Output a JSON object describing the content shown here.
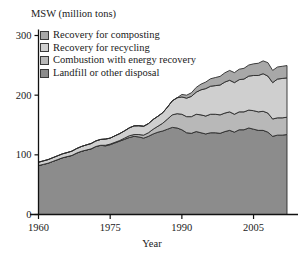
{
  "figure": {
    "clipped_top_title": "",
    "y_axis_title": "MSW (million tons)",
    "x_axis_title": "Year"
  },
  "legend": {
    "items": [
      {
        "label": "Recovery for composting",
        "color": "#a8a8a8",
        "swatch": "legend-swatch-composting"
      },
      {
        "label": "Recovery for recycling",
        "color": "#cfcfcf",
        "swatch": "legend-swatch-recycling"
      },
      {
        "label": "Combustion with energy recovery",
        "color": "#b8b8b8",
        "swatch": "legend-swatch-combustion"
      },
      {
        "label": "Landfill or other disposal",
        "color": "#8c8c8c",
        "swatch": "legend-swatch-landfill"
      }
    ]
  },
  "axes": {
    "y_ticks": [
      "0",
      "100",
      "200",
      "300"
    ],
    "x_ticks": [
      "1960",
      "1975",
      "1990",
      "2005"
    ]
  },
  "chart_data": {
    "type": "area",
    "title": "MSW (million tons)",
    "xlabel": "Year",
    "ylabel": "MSW (million tons)",
    "xlim": [
      1960,
      2012
    ],
    "ylim": [
      0,
      300
    ],
    "grid": false,
    "legend_position": "top-left-inside",
    "stacked": true,
    "stack_order_bottom_to_top": [
      "Landfill or other disposal",
      "Combustion with energy recovery",
      "Recovery for recycling",
      "Recovery for composting"
    ],
    "x": [
      1960,
      1961,
      1962,
      1963,
      1964,
      1965,
      1966,
      1967,
      1968,
      1969,
      1970,
      1971,
      1972,
      1973,
      1974,
      1975,
      1976,
      1977,
      1978,
      1979,
      1980,
      1981,
      1982,
      1983,
      1984,
      1985,
      1986,
      1987,
      1988,
      1989,
      1990,
      1991,
      1992,
      1993,
      1994,
      1995,
      1996,
      1997,
      1998,
      1999,
      2000,
      2001,
      2002,
      2003,
      2004,
      2005,
      2006,
      2007,
      2008,
      2009,
      2010,
      2011,
      2012
    ],
    "series": [
      {
        "name": "Landfill or other disposal",
        "color": "#8c8c8c",
        "values": [
          82,
          84,
          86,
          89,
          92,
          95,
          97,
          99,
          103,
          106,
          108,
          110,
          114,
          116,
          115,
          117,
          120,
          123,
          126,
          129,
          131,
          130,
          128,
          131,
          135,
          138,
          140,
          143,
          146,
          145,
          142,
          137,
          136,
          139,
          137,
          135,
          137,
          137,
          136,
          139,
          141,
          138,
          142,
          142,
          145,
          143,
          141,
          141,
          138,
          131,
          133,
          133,
          134
        ]
      },
      {
        "name": "Combustion with energy recovery",
        "color": "#b8b8b8",
        "values": [
          0,
          0,
          0,
          0,
          0,
          0,
          0,
          0,
          0,
          0,
          0,
          0,
          0,
          0,
          1,
          1,
          1,
          1,
          2,
          3,
          3,
          4,
          5,
          6,
          8,
          10,
          13,
          17,
          21,
          24,
          26,
          27,
          28,
          29,
          30,
          30,
          31,
          31,
          31,
          31,
          31,
          30,
          30,
          30,
          30,
          31,
          31,
          32,
          32,
          29,
          29,
          29,
          29
        ]
      },
      {
        "name": "Recovery for recycling",
        "color": "#cfcfcf",
        "values": [
          5.6,
          5.8,
          6.0,
          6.2,
          6.4,
          6.6,
          6.8,
          7.2,
          7.6,
          8.0,
          8.6,
          8.9,
          9.3,
          9.8,
          10.4,
          10.0,
          10.9,
          11.6,
          12.2,
          13.2,
          14.5,
          14.8,
          14.9,
          15.3,
          16.3,
          16.7,
          17.6,
          20.1,
          23.5,
          26.6,
          29.0,
          31.0,
          34.0,
          37.0,
          42.0,
          46.0,
          47.0,
          48.0,
          50.0,
          52.0,
          53.0,
          53.0,
          54.0,
          55.0,
          57.0,
          59.0,
          61.0,
          63.0,
          62.0,
          61.0,
          65.0,
          66.0,
          66.0
        ]
      },
      {
        "name": "Recovery for composting",
        "color": "#a8a8a8",
        "values": [
          0,
          0,
          0,
          0,
          0,
          0,
          0,
          0,
          0,
          0,
          0,
          0,
          0,
          0,
          0,
          0,
          0,
          0,
          0,
          0,
          0,
          0,
          0,
          0,
          0,
          0,
          0,
          0,
          0,
          0,
          4.2,
          5.0,
          6.0,
          8.0,
          9.5,
          11.0,
          12.5,
          13.5,
          14.5,
          15.5,
          16.5,
          16.8,
          17.5,
          18.0,
          18.5,
          19.5,
          20.5,
          21.5,
          22.5,
          20.5,
          20.2,
          20.4,
          20.6
        ]
      }
    ],
    "totals": [
      88,
      90,
      92,
      95,
      98,
      102,
      104,
      106,
      111,
      114,
      117,
      119,
      123,
      126,
      126,
      128,
      132,
      136,
      140,
      145,
      149,
      149,
      148,
      152,
      159,
      165,
      171,
      180,
      190,
      196,
      201,
      200,
      204,
      213,
      219,
      222,
      228,
      230,
      232,
      238,
      242,
      238,
      244,
      245,
      251,
      253,
      254,
      258,
      255,
      242,
      247,
      248,
      250
    ]
  }
}
